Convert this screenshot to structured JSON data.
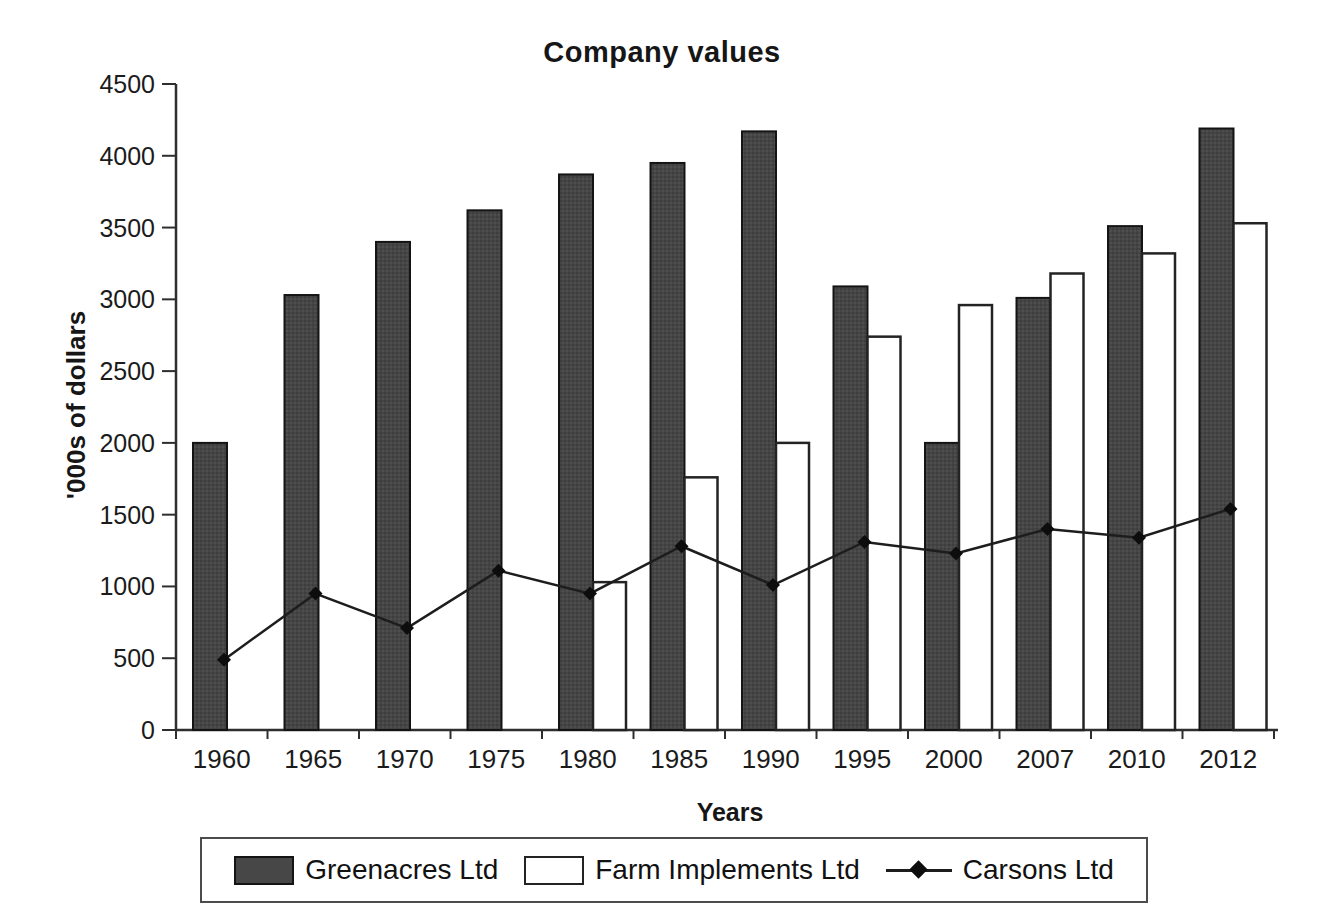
{
  "chart_data": {
    "type": "bar",
    "title": "Company values",
    "xlabel": "Years",
    "ylabel": "'000s of dollars",
    "categories": [
      "1960",
      "1965",
      "1970",
      "1975",
      "1980",
      "1985",
      "1990",
      "1995",
      "2000",
      "2007",
      "2010",
      "2012"
    ],
    "ylim": [
      0,
      4500
    ],
    "ytick_step": 500,
    "grid": false,
    "legend_position": "bottom",
    "colors": {
      "dark_bar_fill": "#474747",
      "dark_bar_border": "#141414",
      "white_bar_fill": "#ffffff",
      "white_bar_border": "#232323",
      "line_color": "#1d1d1d",
      "marker_color": "#0d0d0d",
      "axis_color": "#2e2e2e",
      "text_color": "#1b1b1b"
    },
    "series": [
      {
        "name": "Greenacres Ltd",
        "kind": "bar",
        "style": "dark",
        "values": [
          2000,
          3030,
          3400,
          3620,
          3870,
          3950,
          4170,
          3090,
          2000,
          3010,
          3510,
          4190
        ]
      },
      {
        "name": "Farm Implements Ltd",
        "kind": "bar",
        "style": "light",
        "values": [
          0,
          0,
          0,
          0,
          1030,
          1760,
          2000,
          2740,
          2960,
          3180,
          3320,
          3530
        ]
      },
      {
        "name": "Carsons Ltd",
        "kind": "line",
        "marker": "diamond",
        "values": [
          490,
          950,
          710,
          1110,
          950,
          1280,
          1010,
          1310,
          1230,
          1400,
          1340,
          1540
        ]
      }
    ]
  }
}
